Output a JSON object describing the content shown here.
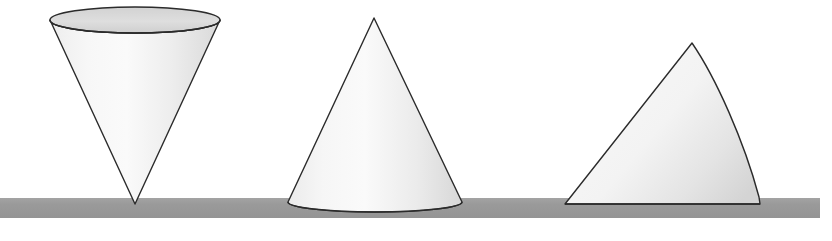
{
  "figure": {
    "background_color": "#ffffff",
    "width": 832,
    "height": 241,
    "caption_text": ""
  },
  "ground": {
    "label": "ground-surface",
    "color": "#999999",
    "edge_color": "#8f8f8f",
    "x": 0,
    "y": 198,
    "width": 820,
    "height": 20
  },
  "palette": {
    "outline": "#2b2b2b",
    "fill_light": "#fbfbfb",
    "fill_mid": "#e9e9e9",
    "fill_dark": "#cfcfcf",
    "ellipse_top_light": "#e2e2e2",
    "ellipse_top_dark": "#c9c9c9",
    "ground": "#999999"
  },
  "shapes": [
    {
      "id": "cone-inverted",
      "name": "cone-inverted-apex-down",
      "order": 1,
      "orientation": "apex-down",
      "equilibrium": "unstable",
      "apex": {
        "x": 135,
        "y": 204
      },
      "base_ellipse": {
        "cx": 135,
        "cy": 20,
        "rx": 85,
        "ry": 13
      },
      "left_rim": {
        "x": 50,
        "y": 20
      },
      "right_rim": {
        "x": 220,
        "y": 20
      },
      "contact_point": {
        "x": 135,
        "y": 203
      }
    },
    {
      "id": "cone-upright",
      "name": "cone-upright-base-down",
      "order": 2,
      "orientation": "apex-up",
      "equilibrium": "stable",
      "apex": {
        "x": 374,
        "y": 18
      },
      "base_ellipse": {
        "cx": 375,
        "cy": 203,
        "rx": 87,
        "ry": 10
      },
      "left_base": {
        "x": 288,
        "y": 202
      },
      "right_base": {
        "x": 462,
        "y": 202
      },
      "contact_point": {
        "x": 375,
        "y": 213
      }
    },
    {
      "id": "cone-tilted",
      "name": "cone-tilted-on-slant-side",
      "order": 3,
      "orientation": "lying-on-slant",
      "equilibrium": "neutral",
      "apex": {
        "x": 565,
        "y": 204
      },
      "peak": {
        "x": 692,
        "y": 43
      },
      "base_corner": {
        "x": 760,
        "y": 204
      },
      "contact_edge": {
        "x1": 565,
        "x2": 760,
        "y": 203
      }
    }
  ],
  "chart_data": {
    "type": "diagram",
    "items": [
      {
        "label": "inverted cone",
        "state": "unstable equilibrium",
        "contact": "apex"
      },
      {
        "label": "upright cone",
        "state": "stable equilibrium",
        "contact": "circular base"
      },
      {
        "label": "tilted cone",
        "state": "neutral equilibrium",
        "contact": "slant line"
      }
    ]
  }
}
